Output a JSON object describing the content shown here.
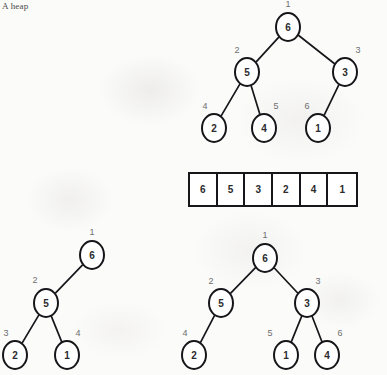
{
  "caption": "A heap",
  "colors": {
    "ink": "#16161a",
    "index_label": "#6e6e70",
    "page_background": "#fbfbfa",
    "node_fill": "#ffffff"
  },
  "diagram": {
    "heap_tree": {
      "name": "complete-binary-tree-heap",
      "nodes": [
        {
          "id": "t1",
          "value": "6",
          "index_label": "1",
          "x": 288,
          "y": 27
        },
        {
          "id": "t2",
          "value": "5",
          "index_label": "2",
          "x": 247,
          "y": 72
        },
        {
          "id": "t3",
          "value": "3",
          "index_label": "3",
          "x": 345,
          "y": 72
        },
        {
          "id": "t4",
          "value": "2",
          "index_label": "4",
          "x": 214,
          "y": 128
        },
        {
          "id": "t5",
          "value": "4",
          "index_label": "5",
          "x": 264,
          "y": 128
        },
        {
          "id": "t6",
          "value": "1",
          "index_label": "6",
          "x": 318,
          "y": 128
        }
      ],
      "index_label_positions": [
        {
          "text": "1",
          "x": 288,
          "y": 4
        },
        {
          "text": "2",
          "x": 237,
          "y": 50
        },
        {
          "text": "3",
          "x": 358,
          "y": 50
        },
        {
          "text": "4",
          "x": 205,
          "y": 106
        },
        {
          "text": "5",
          "x": 276,
          "y": 106
        },
        {
          "text": "6",
          "x": 307,
          "y": 106
        }
      ],
      "edges": [
        {
          "from": "t1",
          "to": "t2"
        },
        {
          "from": "t1",
          "to": "t3"
        },
        {
          "from": "t2",
          "to": "t4"
        },
        {
          "from": "t2",
          "to": "t5"
        },
        {
          "from": "t3",
          "to": "t6"
        }
      ]
    },
    "array": {
      "name": "heap-array-representation",
      "values": [
        "6",
        "5",
        "3",
        "2",
        "4",
        "1"
      ],
      "x": 188,
      "y": 172,
      "width": 170,
      "height": 35
    },
    "left_tree": {
      "name": "left-partial-tree",
      "nodes": [
        {
          "id": "l1",
          "value": "6",
          "index_label": "1",
          "x": 92,
          "y": 255
        },
        {
          "id": "l2",
          "value": "5",
          "index_label": "2",
          "x": 46,
          "y": 303
        },
        {
          "id": "l3",
          "value": "2",
          "index_label": "3",
          "x": 15,
          "y": 355
        },
        {
          "id": "l4",
          "value": "1",
          "index_label": "4",
          "x": 67,
          "y": 355
        }
      ],
      "index_label_positions": [
        {
          "text": "1",
          "x": 92,
          "y": 232
        },
        {
          "text": "2",
          "x": 35,
          "y": 280
        },
        {
          "text": "3",
          "x": 6,
          "y": 333
        },
        {
          "text": "4",
          "x": 78,
          "y": 333
        }
      ],
      "edges": [
        {
          "from": "l1",
          "to": "l2"
        },
        {
          "from": "l2",
          "to": "l3"
        },
        {
          "from": "l2",
          "to": "l4"
        }
      ]
    },
    "right_tree": {
      "name": "right-partial-tree",
      "nodes": [
        {
          "id": "r1",
          "value": "6",
          "index_label": "1",
          "x": 265,
          "y": 258
        },
        {
          "id": "r2",
          "value": "5",
          "index_label": "2",
          "x": 221,
          "y": 303
        },
        {
          "id": "r3",
          "value": "3",
          "index_label": "3",
          "x": 307,
          "y": 303
        },
        {
          "id": "r4",
          "value": "2",
          "index_label": "4",
          "x": 194,
          "y": 355
        },
        {
          "id": "r5",
          "value": "1",
          "index_label": "5",
          "x": 286,
          "y": 355
        },
        {
          "id": "r6",
          "value": "4",
          "index_label": "6",
          "x": 327,
          "y": 355
        }
      ],
      "index_label_positions": [
        {
          "text": "1",
          "x": 265,
          "y": 235
        },
        {
          "text": "2",
          "x": 211,
          "y": 281
        },
        {
          "text": "3",
          "x": 318,
          "y": 281
        },
        {
          "text": "4",
          "x": 185,
          "y": 333
        },
        {
          "text": "5",
          "x": 270,
          "y": 333
        },
        {
          "text": "6",
          "x": 340,
          "y": 333
        }
      ],
      "edges": [
        {
          "from": "r1",
          "to": "r2"
        },
        {
          "from": "r1",
          "to": "r3"
        },
        {
          "from": "r2",
          "to": "r4"
        },
        {
          "from": "r3",
          "to": "r5"
        },
        {
          "from": "r3",
          "to": "r6"
        }
      ]
    }
  }
}
